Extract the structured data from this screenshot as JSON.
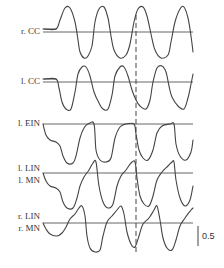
{
  "chart_data": {
    "type": "line",
    "title": "",
    "xlabel": "",
    "ylabel": "",
    "grid": false,
    "legend": "none",
    "scale_bar": {
      "value": 0.5,
      "label": "0.5"
    },
    "marker": {
      "type": "dashed-vertical-line",
      "x_fraction": 0.62
    },
    "series": [
      {
        "name": "r. CC",
        "labels": [
          "r. CC"
        ],
        "baseline_y": 32,
        "points": [
          [
            44,
            29
          ],
          [
            56,
            29
          ],
          [
            60,
            20
          ],
          [
            65,
            8
          ],
          [
            70,
            8
          ],
          [
            75,
            22
          ],
          [
            78,
            40
          ],
          [
            80,
            52
          ],
          [
            84,
            58
          ],
          [
            88,
            56
          ],
          [
            92,
            46
          ],
          [
            95,
            22
          ],
          [
            99,
            9
          ],
          [
            104,
            7
          ],
          [
            108,
            18
          ],
          [
            111,
            36
          ],
          [
            114,
            50
          ],
          [
            120,
            58
          ],
          [
            126,
            55
          ],
          [
            130,
            44
          ],
          [
            134,
            22
          ],
          [
            138,
            9
          ],
          [
            143,
            7
          ],
          [
            147,
            16
          ],
          [
            151,
            34
          ],
          [
            155,
            50
          ],
          [
            161,
            58
          ],
          [
            168,
            55
          ],
          [
            171,
            42
          ],
          [
            175,
            22
          ],
          [
            180,
            9
          ],
          [
            184,
            7
          ],
          [
            188,
            18
          ],
          [
            191,
            36
          ],
          [
            193,
            52
          ]
        ]
      },
      {
        "name": "l. CC",
        "labels": [
          "l. CC"
        ],
        "baseline_y": 82,
        "points": [
          [
            44,
            79
          ],
          [
            56,
            79
          ],
          [
            59,
            88
          ],
          [
            62,
            102
          ],
          [
            66,
            109
          ],
          [
            71,
            109
          ],
          [
            75,
            92
          ],
          [
            78,
            74
          ],
          [
            82,
            67
          ],
          [
            86,
            67
          ],
          [
            90,
            76
          ],
          [
            94,
            92
          ],
          [
            99,
            103
          ],
          [
            103,
            109
          ],
          [
            108,
            109
          ],
          [
            112,
            95
          ],
          [
            115,
            76
          ],
          [
            120,
            67
          ],
          [
            124,
            67
          ],
          [
            128,
            76
          ],
          [
            132,
            90
          ],
          [
            136,
            100
          ],
          [
            140,
            106
          ],
          [
            146,
            109
          ],
          [
            150,
            100
          ],
          [
            153,
            82
          ],
          [
            157,
            68
          ],
          [
            162,
            66
          ],
          [
            166,
            72
          ],
          [
            169,
            86
          ],
          [
            172,
            97
          ],
          [
            178,
            106
          ],
          [
            184,
            109
          ],
          [
            188,
            98
          ],
          [
            191,
            84
          ],
          [
            193,
            74
          ]
        ]
      },
      {
        "name": "l. EIN",
        "labels": [
          "l. EIN"
        ],
        "baseline_y": 124,
        "points": [
          [
            43,
            124
          ],
          [
            46,
            135
          ],
          [
            50,
            140
          ],
          [
            56,
            142
          ],
          [
            60,
            146
          ],
          [
            63,
            156
          ],
          [
            67,
            163
          ],
          [
            73,
            163
          ],
          [
            76,
            156
          ],
          [
            80,
            138
          ],
          [
            84,
            128
          ],
          [
            88,
            124
          ],
          [
            94,
            124
          ],
          [
            96,
            150
          ],
          [
            100,
            160
          ],
          [
            106,
            162
          ],
          [
            111,
            158
          ],
          [
            115,
            138
          ],
          [
            120,
            127
          ],
          [
            126,
            124
          ],
          [
            134,
            124
          ],
          [
            136,
            134
          ],
          [
            139,
            150
          ],
          [
            143,
            158
          ],
          [
            148,
            160
          ],
          [
            153,
            150
          ],
          [
            157,
            133
          ],
          [
            162,
            126
          ],
          [
            170,
            124
          ],
          [
            174,
            124
          ],
          [
            176,
            144
          ],
          [
            180,
            156
          ],
          [
            186,
            160
          ],
          [
            191,
            152
          ],
          [
            193,
            140
          ]
        ]
      },
      {
        "name": "l. LIN / l. MN",
        "labels": [
          "l. LIN",
          "l. MN"
        ],
        "baseline_y": 173,
        "points": [
          [
            43,
            173
          ],
          [
            46,
            181
          ],
          [
            50,
            186
          ],
          [
            56,
            188
          ],
          [
            60,
            192
          ],
          [
            63,
            202
          ],
          [
            67,
            208
          ],
          [
            73,
            208
          ],
          [
            77,
            198
          ],
          [
            80,
            186
          ],
          [
            84,
            177
          ],
          [
            89,
            170
          ],
          [
            93,
            163
          ],
          [
            96,
            162
          ],
          [
            99,
            186
          ],
          [
            103,
            202
          ],
          [
            108,
            208
          ],
          [
            113,
            204
          ],
          [
            117,
            186
          ],
          [
            121,
            176
          ],
          [
            126,
            170
          ],
          [
            131,
            163
          ],
          [
            135,
            162
          ],
          [
            137,
            178
          ],
          [
            140,
            196
          ],
          [
            144,
            204
          ],
          [
            149,
            206
          ],
          [
            153,
            196
          ],
          [
            157,
            180
          ],
          [
            162,
            172
          ],
          [
            168,
            166
          ],
          [
            172,
            162
          ],
          [
            174,
            162
          ],
          [
            176,
            180
          ],
          [
            180,
            198
          ],
          [
            185,
            206
          ],
          [
            190,
            200
          ],
          [
            193,
            186
          ]
        ]
      },
      {
        "name": "r. LIN / r. MN",
        "labels": [
          "r. LIN",
          "r. MN"
        ],
        "baseline_y": 223,
        "points": [
          [
            43,
            223
          ],
          [
            46,
            229
          ],
          [
            50,
            234
          ],
          [
            57,
            236
          ],
          [
            62,
            233
          ],
          [
            66,
            227
          ],
          [
            70,
            219
          ],
          [
            75,
            214
          ],
          [
            79,
            208
          ],
          [
            82,
            206
          ],
          [
            85,
            216
          ],
          [
            87,
            236
          ],
          [
            90,
            248
          ],
          [
            95,
            252
          ],
          [
            100,
            250
          ],
          [
            103,
            236
          ],
          [
            107,
            222
          ],
          [
            112,
            216
          ],
          [
            117,
            210
          ],
          [
            121,
            206
          ],
          [
            124,
            214
          ],
          [
            127,
            232
          ],
          [
            131,
            244
          ],
          [
            135,
            247
          ],
          [
            139,
            236
          ],
          [
            143,
            224
          ],
          [
            149,
            218
          ],
          [
            154,
            210
          ],
          [
            157,
            206
          ],
          [
            160,
            220
          ],
          [
            163,
            238
          ],
          [
            167,
            248
          ],
          [
            172,
            250
          ],
          [
            176,
            240
          ],
          [
            180,
            226
          ],
          [
            185,
            218
          ],
          [
            191,
            210
          ],
          [
            193,
            208
          ]
        ]
      }
    ]
  },
  "labels": {
    "r_cc": "r. CC",
    "l_cc": "l. CC",
    "l_ein": "l. EIN",
    "l_lin": "l. LIN",
    "l_mn": "l. MN",
    "r_lin": "r. LIN",
    "r_mn": "r. MN",
    "scale": "0.5"
  }
}
